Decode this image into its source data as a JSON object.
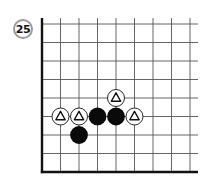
{
  "problem": {
    "number": "25"
  },
  "board": {
    "origin": {
      "x": 42,
      "y": 24
    },
    "spacing": 18.5,
    "columns": 9,
    "rows": 9,
    "right_extent": 198,
    "edges": [
      "left",
      "bottom"
    ],
    "line_color": "#555555",
    "edge_color": "#111111"
  },
  "stones": [
    {
      "color": "white",
      "col": 4,
      "row": 4,
      "marker": "triangle"
    },
    {
      "color": "white",
      "col": 1,
      "row": 5,
      "marker": "triangle"
    },
    {
      "color": "white",
      "col": 2,
      "row": 5,
      "marker": "triangle"
    },
    {
      "color": "black",
      "col": 3,
      "row": 5,
      "marker": null
    },
    {
      "color": "black",
      "col": 4,
      "row": 5,
      "marker": null
    },
    {
      "color": "white",
      "col": 5,
      "row": 5,
      "marker": "triangle"
    },
    {
      "color": "black",
      "col": 2,
      "row": 6,
      "marker": null
    }
  ],
  "colors": {
    "black_stone": "#0a0a0a",
    "white_stone": "#ffffff",
    "stone_outline": "#111111",
    "badge_ring": "#9a9a9a"
  }
}
